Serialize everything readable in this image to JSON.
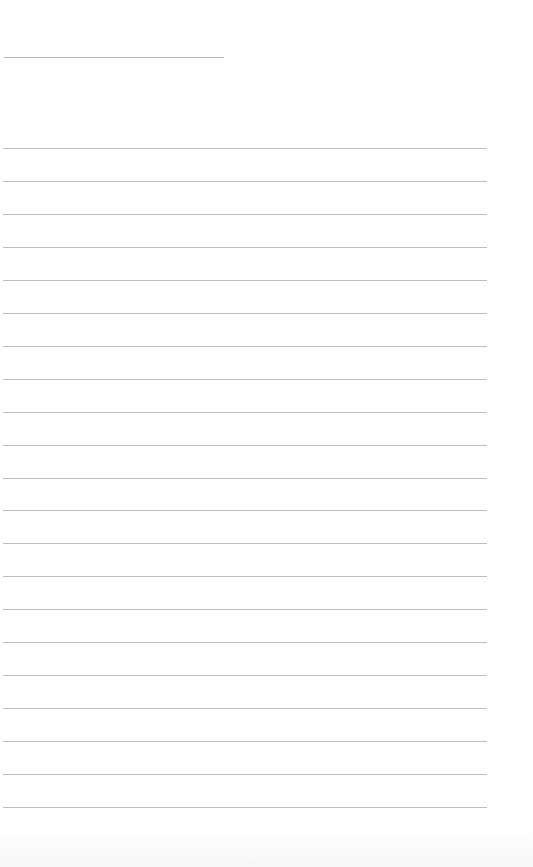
{
  "document": {
    "type": "blank lined paper",
    "header_line": {
      "x": 4,
      "y": 57,
      "width": 220
    },
    "ruled_lines": {
      "count": 21,
      "start_y": 148,
      "spacing": 32.95,
      "x": 3,
      "width": 484,
      "color": "#bdbdbd"
    },
    "background": "#fefefe"
  }
}
